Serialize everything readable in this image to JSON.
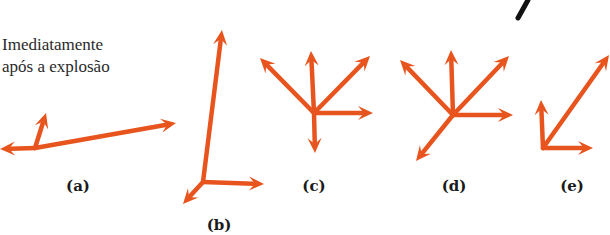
{
  "caption": {
    "line1": "Imediatamente",
    "line2": "após a explosão"
  },
  "colors": {
    "arrow": "#E8541E",
    "text": "#1a1a1a",
    "stroke_mark": "#111111"
  },
  "panels": [
    {
      "id": "a",
      "label": "(a)",
      "label_pos": [
        78,
        186
      ],
      "origin": [
        35,
        148
      ],
      "arrows": [
        {
          "to": [
            0,
            149
          ]
        },
        {
          "to": [
            46,
            113
          ]
        },
        {
          "to": [
            176,
            123
          ]
        }
      ]
    },
    {
      "id": "b",
      "label": "(b)",
      "label_pos": [
        219,
        225
      ],
      "origin": [
        203,
        182
      ],
      "arrows": [
        {
          "to": [
            222,
            30
          ]
        },
        {
          "to": [
            264,
            184
          ]
        },
        {
          "to": [
            183,
            204
          ]
        }
      ]
    },
    {
      "id": "c",
      "label": "(c)",
      "label_pos": [
        314,
        186
      ],
      "origin": [
        314,
        113
      ],
      "arrows": [
        {
          "to": [
            311,
            51
          ]
        },
        {
          "to": [
            260,
            58
          ]
        },
        {
          "to": [
            370,
            56
          ]
        },
        {
          "to": [
            373,
            113
          ]
        },
        {
          "to": [
            315,
            153
          ]
        }
      ]
    },
    {
      "id": "d",
      "label": "(d)",
      "label_pos": [
        454,
        186
      ],
      "origin": [
        453,
        115
      ],
      "arrows": [
        {
          "to": [
            451,
            50
          ]
        },
        {
          "to": [
            400,
            60
          ]
        },
        {
          "to": [
            509,
            56
          ]
        },
        {
          "to": [
            513,
            115
          ]
        },
        {
          "to": [
            416,
            161
          ]
        }
      ]
    },
    {
      "id": "e",
      "label": "(e)",
      "label_pos": [
        572,
        186
      ],
      "origin": [
        543,
        148
      ],
      "arrows": [
        {
          "to": [
            541,
            100
          ]
        },
        {
          "to": [
            609,
            55
          ]
        },
        {
          "to": [
            593,
            148
          ]
        }
      ]
    }
  ],
  "marks": {
    "top_right_stroke": {
      "from": [
        528,
        0
      ],
      "to": [
        518,
        18
      ]
    }
  }
}
